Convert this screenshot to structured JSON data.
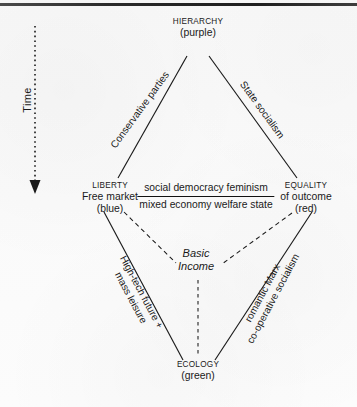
{
  "diagram": {
    "title_present": false,
    "background_color": "#fbfbfb",
    "ink_color": "#1a1a1a"
  },
  "axis": {
    "time_label": "Time",
    "direction": "downward",
    "style": "dotted-arrow"
  },
  "vertices": {
    "top": {
      "name": "HIERARCHY",
      "color_word": "(purple)",
      "color_hex": "#7d3fa0"
    },
    "left": {
      "name": "LIBERTY",
      "subtitle": "Free market",
      "color_word": "(blue)",
      "color_hex": "#2255aa"
    },
    "right": {
      "name": "EQUALITY",
      "subtitle": "of outcome",
      "color_word": "(red)",
      "color_hex": "#cc2222"
    },
    "bottom": {
      "name": "ECOLOGY",
      "color_word": "(green)",
      "color_hex": "#2e8b35"
    }
  },
  "edge_labels": {
    "top_left": "Conservative parties",
    "top_right": "State socialism",
    "bottom_left_line1": "High-tech future +",
    "bottom_left_line2": "mass leisure",
    "bottom_right_line1": "romantic Marx",
    "bottom_right_line2": "co-operative socialism"
  },
  "center": {
    "fraction_numerator": "social democracy feminism",
    "fraction_denominator": "mixed economy welfare state",
    "basic_income_line1": "Basic",
    "basic_income_line2": "Income"
  }
}
